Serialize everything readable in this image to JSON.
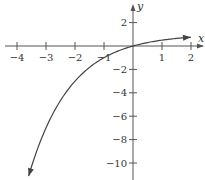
{
  "chart_data": {
    "type": "line",
    "title": "",
    "xlabel": "x",
    "ylabel": "y",
    "function": "y = 1 - 2^(-x)",
    "xlim": [
      -4.2,
      2.4
    ],
    "ylim": [
      -11,
      3.5
    ],
    "grid": false,
    "x_ticks": [
      -4,
      -3,
      -2,
      -1,
      1,
      2
    ],
    "x_tick_labels": [
      "−4",
      "−3",
      "−2",
      "−1",
      "1",
      "2"
    ],
    "y_ticks": [
      2,
      -2,
      -4,
      -6,
      -8,
      -10
    ],
    "y_tick_labels": [
      "2",
      "−2",
      "−4",
      "−6",
      "−8",
      "−10"
    ],
    "series": [
      {
        "name": "curve",
        "x": [
          -3.6,
          -3,
          -2.5,
          -2,
          -1.5,
          -1,
          -0.5,
          0,
          0.5,
          1,
          1.5,
          2
        ],
        "y": [
          -11.1,
          -7,
          -4.66,
          -3,
          -1.83,
          -1,
          -0.41,
          0,
          0.29,
          0.5,
          0.65,
          0.75
        ],
        "arrows": "both ends"
      }
    ],
    "colors": {
      "axis": "#555555",
      "curve": "#444444"
    }
  }
}
